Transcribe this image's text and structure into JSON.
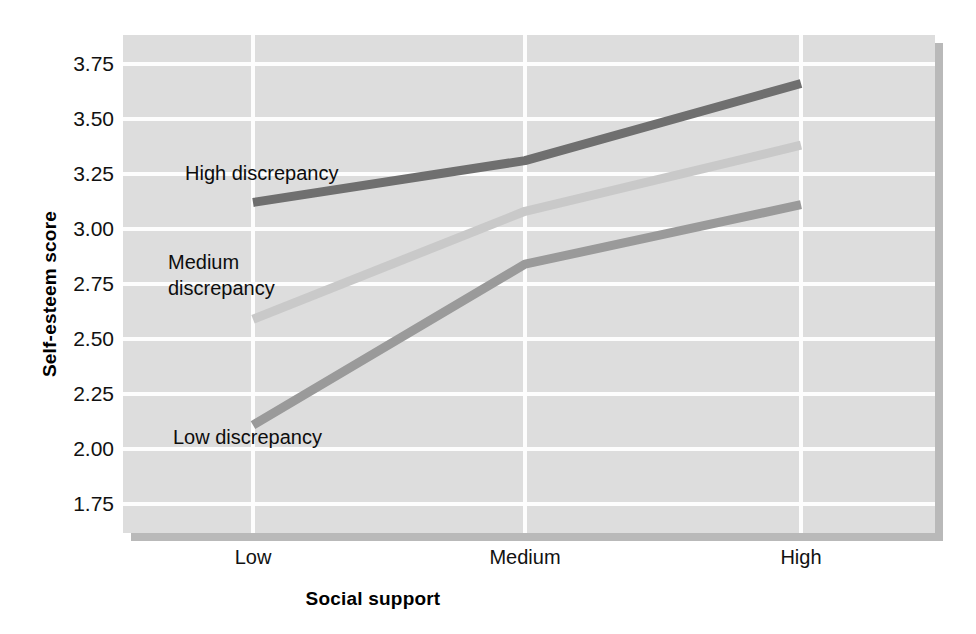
{
  "chart_data": {
    "type": "line",
    "title": "",
    "xlabel": "Social support",
    "ylabel": "Self-esteem score",
    "categories": [
      "Low",
      "Medium",
      "High"
    ],
    "x_tick_labels": [
      "Low",
      "Medium",
      "High"
    ],
    "y_tick_labels": [
      "3.75",
      "3.50",
      "3.25",
      "3.00",
      "2.75",
      "2.50",
      "2.25",
      "2.00",
      "1.75"
    ],
    "y_tick_values": [
      3.75,
      3.5,
      3.25,
      3.0,
      2.75,
      2.5,
      2.25,
      2.0,
      1.75
    ],
    "ylim": [
      1.62,
      3.88
    ],
    "grid": true,
    "legend_position": "inline-annotations",
    "series": [
      {
        "name": "High discrepancy",
        "label": "High discrepancy",
        "color": "#6f6f6f",
        "values": [
          3.12,
          3.31,
          3.66
        ]
      },
      {
        "name": "Medium discrepancy",
        "label": "Medium\ndiscrepancy",
        "color": "#c9c9c9",
        "values": [
          2.59,
          3.08,
          3.38
        ]
      },
      {
        "name": "Low discrepancy",
        "label": "Low discrepancy",
        "color": "#9a9a9a",
        "values": [
          2.11,
          2.84,
          3.11
        ]
      }
    ],
    "annotations": [
      {
        "text": "High discrepancy",
        "series": "High discrepancy"
      },
      {
        "text": "Medium\ndiscrepancy",
        "series": "Medium discrepancy"
      },
      {
        "text": "Low discrepancy",
        "series": "Low discrepancy"
      }
    ],
    "colors": {
      "plot_background": "#dddddd",
      "gridline": "#fdfdfd",
      "shadow": "#b9b9b9",
      "text": "#111111"
    }
  }
}
